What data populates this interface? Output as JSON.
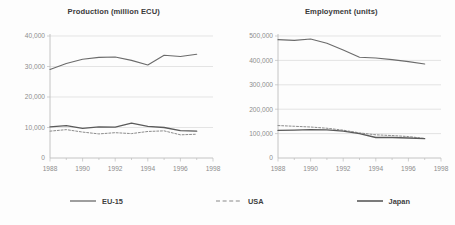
{
  "figure": {
    "background_color": "#fdfdfd",
    "grid_color": "#d9d9d9",
    "axis_color": "#bdbdbd",
    "line_color": "#5a5a5a",
    "tick_text_color": "#8d8d8d",
    "title_text_color": "#3a3a3a"
  },
  "legend": {
    "position": "bottom",
    "items": [
      {
        "label": "EU-15",
        "style": "solid",
        "color": "#6b6b6b",
        "width": 1.3
      },
      {
        "label": "USA",
        "style": "dashed",
        "color": "#8a8a8a",
        "width": 1.1
      },
      {
        "label": "Japan",
        "style": "solid",
        "color": "#5a5a5a",
        "width": 1.6
      }
    ]
  },
  "chart_data": [
    {
      "type": "line",
      "title": "Production (million ECU)",
      "xlabel": "",
      "ylabel": "",
      "xlim": [
        1988,
        1998
      ],
      "ylim": [
        0,
        40000
      ],
      "xticks": [
        1988,
        1990,
        1992,
        1994,
        1996,
        1998
      ],
      "xticklabels": [
        "1988",
        "1990",
        "1992",
        "1994",
        "1996",
        "1998"
      ],
      "yticks": [
        0,
        10000,
        20000,
        30000,
        40000
      ],
      "yticklabels": [
        "0",
        "10,000",
        "20,000",
        "30,000",
        "40,000"
      ],
      "grid": true,
      "legend_position": "bottom",
      "x": [
        1988,
        1989,
        1990,
        1991,
        1992,
        1993,
        1994,
        1995,
        1996,
        1997
      ],
      "series": [
        {
          "name": "EU-15",
          "style": "solid",
          "values": [
            29000,
            31000,
            32400,
            33000,
            33100,
            32000,
            30500,
            33700,
            33300,
            34000
          ]
        },
        {
          "name": "USA",
          "style": "dashed",
          "values": [
            8800,
            9300,
            8500,
            7900,
            8300,
            8000,
            8700,
            8900,
            7600,
            7800
          ]
        },
        {
          "name": "Japan",
          "style": "solid",
          "values": [
            10200,
            10600,
            9700,
            10200,
            10100,
            11400,
            10400,
            10000,
            9000,
            8800
          ]
        }
      ]
    },
    {
      "type": "line",
      "title": "Employment (units)",
      "xlabel": "",
      "ylabel": "",
      "xlim": [
        1988,
        1998
      ],
      "ylim": [
        0,
        500000
      ],
      "xticks": [
        1988,
        1990,
        1992,
        1994,
        1996,
        1998
      ],
      "xticklabels": [
        "1988",
        "1990",
        "1992",
        "1994",
        "1996",
        "1998"
      ],
      "yticks": [
        0,
        100000,
        200000,
        300000,
        400000,
        500000
      ],
      "yticklabels": [
        "0",
        "100,000",
        "200,000",
        "300,000",
        "400,000",
        "500,000"
      ],
      "grid": true,
      "legend_position": "bottom",
      "x": [
        1988,
        1989,
        1990,
        1991,
        1992,
        1993,
        1994,
        1995,
        1996,
        1997
      ],
      "series": [
        {
          "name": "EU-15",
          "style": "solid",
          "values": [
            485000,
            482000,
            488000,
            470000,
            443000,
            413000,
            410000,
            403000,
            395000,
            385000
          ]
        },
        {
          "name": "USA",
          "style": "dashed",
          "values": [
            133000,
            130000,
            127000,
            122000,
            114000,
            103000,
            95000,
            92000,
            88000,
            80000
          ]
        },
        {
          "name": "Japan",
          "style": "solid",
          "values": [
            113000,
            114000,
            116000,
            115000,
            110000,
            100000,
            84000,
            84000,
            82000,
            79000
          ]
        }
      ]
    }
  ]
}
